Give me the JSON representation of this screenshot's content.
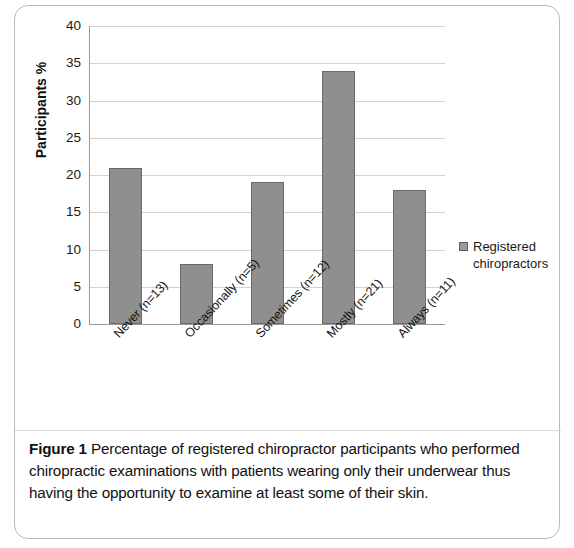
{
  "figure": {
    "caption_label": "Figure 1",
    "caption_text": "Percentage of registered chiropractor participants who performed chiropractic examinations with patients wearing only their underwear thus having the opportunity to examine at least some of their skin."
  },
  "legend": {
    "entries": [
      {
        "label": "Registered chiropractors",
        "color": "#9a9a9a"
      }
    ]
  },
  "chart_data": {
    "type": "bar",
    "title": "",
    "xlabel": "",
    "ylabel": "Participants %",
    "categories": [
      "Never (n=13)",
      "Occasionally (n=5)",
      "Sometimes (n=12)",
      "Mostly (n=21)",
      "Always (n=11)"
    ],
    "series": [
      {
        "name": "Registered chiropractors",
        "values": [
          21,
          8,
          19,
          34,
          18
        ],
        "color": "#8f8f8f"
      }
    ],
    "values": [
      21,
      8,
      19,
      34,
      18
    ],
    "ylim": [
      0,
      40
    ],
    "yticks": [
      0,
      5,
      10,
      15,
      20,
      25,
      30,
      35,
      40
    ],
    "ytick_labels": [
      "0",
      "5",
      "10",
      "15",
      "20",
      "25",
      "30",
      "35",
      "40"
    ],
    "grid": true,
    "grid_axis": "y",
    "legend_position": "right"
  }
}
